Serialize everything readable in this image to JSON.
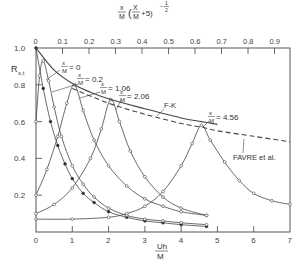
{
  "chart_data": {
    "type": "line",
    "title": "",
    "xlabel": "Uh/M",
    "ylabel": "R_x,t",
    "top_xlabel": "x/M (x/M + 5)^-1/2",
    "xlim": [
      0,
      7
    ],
    "ylim": [
      0,
      1.0
    ],
    "top_xlim": [
      0,
      0.95
    ],
    "x_ticks": [
      "0",
      "1",
      "2",
      "3",
      "4",
      "5",
      "6",
      "7"
    ],
    "y_ticks": [
      "0.2",
      "0.4",
      "0.6",
      "0.8",
      "1.0"
    ],
    "top_ticks": [
      "0",
      "0.1",
      "0.2",
      "0.3",
      "0.4",
      "0.5",
      "0.6",
      "0.7",
      "0.8",
      "0.9"
    ],
    "grid": false,
    "series": [
      {
        "name": "x/M=0",
        "label_text": "x/M = 0",
        "marker": "filled",
        "x": [
          0,
          0.2,
          0.4,
          0.6,
          0.8,
          1.0,
          1.3,
          1.6,
          2.0,
          2.5,
          3.0,
          3.5,
          4.0,
          4.7
        ],
        "y": [
          1.0,
          0.78,
          0.6,
          0.47,
          0.37,
          0.29,
          0.21,
          0.16,
          0.11,
          0.08,
          0.06,
          0.05,
          0.04,
          0.03
        ]
      },
      {
        "name": "x/M=0.2",
        "label_text": "x/M = 0.2",
        "marker": "open",
        "x": [
          0,
          0.1,
          0.2,
          0.35,
          0.5,
          0.7,
          1.0,
          1.3,
          1.6,
          2.0,
          2.5,
          3.0,
          3.5,
          4.0,
          4.7
        ],
        "y": [
          0.6,
          0.85,
          0.93,
          0.82,
          0.68,
          0.52,
          0.36,
          0.26,
          0.19,
          0.13,
          0.09,
          0.07,
          0.06,
          0.05,
          0.04
        ]
      },
      {
        "name": "x/M=1.06",
        "label_text": "x/M = 1.06",
        "marker": "open",
        "x": [
          0,
          0.3,
          0.6,
          0.85,
          1.06,
          1.3,
          1.6,
          2.0,
          2.5,
          3.0,
          3.5,
          4.0,
          4.7
        ],
        "y": [
          0.2,
          0.34,
          0.52,
          0.7,
          0.8,
          0.66,
          0.5,
          0.36,
          0.25,
          0.18,
          0.14,
          0.11,
          0.09
        ]
      },
      {
        "name": "x/M=2.06",
        "label_text": "x/M = 2.06",
        "marker": "open",
        "x": [
          0,
          0.5,
          1.0,
          1.5,
          1.8,
          2.06,
          2.3,
          2.6,
          3.0,
          3.5,
          4.0,
          4.7
        ],
        "y": [
          0.1,
          0.15,
          0.24,
          0.4,
          0.56,
          0.72,
          0.6,
          0.44,
          0.3,
          0.19,
          0.13,
          0.09
        ]
      },
      {
        "name": "x/M=4.56",
        "label_text": "x/M = 4.56",
        "marker": "open",
        "x": [
          0,
          1.0,
          2.0,
          2.5,
          3.0,
          3.5,
          4.0,
          4.3,
          4.56,
          4.8,
          5.2,
          5.6,
          6.0,
          6.5,
          7.0
        ],
        "y": [
          0.07,
          0.07,
          0.08,
          0.1,
          0.14,
          0.22,
          0.36,
          0.48,
          0.58,
          0.5,
          0.38,
          0.28,
          0.21,
          0.17,
          0.15
        ]
      },
      {
        "name": "F-K",
        "label_text": "F-K",
        "style": "solid",
        "x": [
          0,
          0.5,
          1.06,
          1.5,
          2.06,
          3.0,
          4.0,
          4.56,
          5.0
        ],
        "y": [
          1.0,
          0.88,
          0.8,
          0.76,
          0.72,
          0.67,
          0.62,
          0.6,
          0.585
        ]
      },
      {
        "name": "FAVRE et al.",
        "label_text": "FAVRE et al.",
        "style": "dashed",
        "x": [
          1.0,
          2.0,
          3.0,
          4.0,
          4.56,
          5.0,
          6.0,
          7.0
        ],
        "y": [
          0.78,
          0.7,
          0.64,
          0.59,
          0.57,
          0.55,
          0.52,
          0.49
        ]
      }
    ]
  },
  "labels": {
    "y_axis": "R",
    "y_axis_sub": "x,t",
    "x_axis_num": "Uh",
    "x_axis_den": "M",
    "top_frac_num": "x",
    "top_frac_den": "M",
    "top_paren_num": "X",
    "top_paren_den": "M",
    "top_plus": "+5)",
    "top_exp": "-1/2",
    "origin": "0"
  }
}
